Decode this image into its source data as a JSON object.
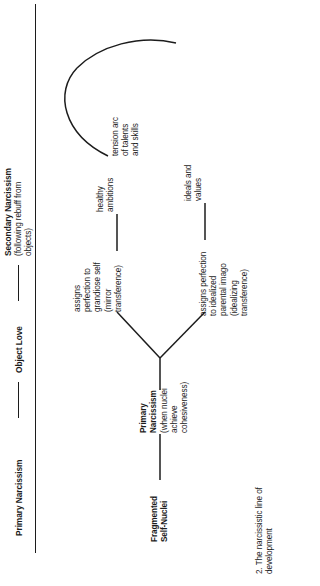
{
  "figure": {
    "caption": "2. The narcissistic line of development",
    "orientation": "rotated-90-ccw",
    "stroke_color": "#1c1c1c",
    "background_color": "#ffffff"
  },
  "headers": [
    {
      "title": "Primary Narcissism",
      "subtitle": ""
    },
    {
      "title": "Object Love",
      "subtitle": ""
    },
    {
      "title": "Secondary Narcissism",
      "subtitle": "(following rebuff from\nobjects)"
    }
  ],
  "nodes": {
    "start": "Fragmented\nSelf-Nuclei",
    "primary": "Primary\nNarcissism",
    "primary_note": "(when nuclei\nachieve\ncohesiveness)",
    "upper_branch": "assigns\nperfection to\ngrandiose self\n(mirror\ntransference)",
    "lower_branch": "assigns perfection\nto idealized\nparental imago\n(idealizing\ntransference)",
    "upper_outcome": "healthy\nambitions",
    "lower_outcome": "ideals and\nvalues",
    "arc_label": "tension arc\nof talents\nand skills"
  }
}
